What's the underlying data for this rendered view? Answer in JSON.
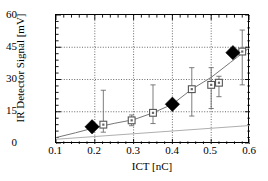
{
  "chart_data": {
    "type": "scatter",
    "title": "",
    "xlabel": "ICT [nC]",
    "ylabel": "IR Detector Signal [mV]",
    "xlim": [
      0.1,
      0.6
    ],
    "ylim": [
      0,
      60
    ],
    "xticks": [
      "0.1",
      "0.2",
      "0.3",
      "0.4",
      "0.5",
      "0.6"
    ],
    "xtick_values": [
      0.1,
      0.2,
      0.3,
      0.4,
      0.5,
      0.6
    ],
    "yticks": [
      "0",
      "15",
      "30",
      "45",
      "60"
    ],
    "ytick_values": [
      0,
      15,
      30,
      45,
      60
    ],
    "grid": "dotted-both",
    "legend": "none",
    "minor_ticks": true,
    "series": [
      {
        "name": "measurement",
        "marker": "open-square",
        "marker_color": "#555555",
        "x": [
          0.222,
          0.295,
          0.35,
          0.45,
          0.5,
          0.52,
          0.58
        ],
        "y": [
          9.0,
          11.0,
          14.5,
          25.5,
          27.5,
          28.5,
          43.0
        ],
        "yerr_low": [
          5.5,
          8.5,
          9.5,
          13.0,
          16.5,
          22.0,
          27.5
        ],
        "yerr_high": [
          25.0,
          13.5,
          27.5,
          35.5,
          35.5,
          31.5,
          53.0
        ]
      },
      {
        "name": "simulation",
        "marker": "filled-diamond",
        "marker_color": "#000000",
        "x": [
          0.193,
          0.4,
          0.556
        ],
        "y": [
          8.0,
          18.5,
          42.5
        ]
      }
    ],
    "lines": [
      {
        "name": "fit-curve",
        "style": "solid-thin",
        "color": "#777777",
        "x": [
          0.1,
          0.15,
          0.2,
          0.25,
          0.3,
          0.35,
          0.4,
          0.45,
          0.5,
          0.55,
          0.6
        ],
        "y": [
          3.0,
          5.2,
          7.6,
          9.6,
          11.3,
          14.5,
          18.5,
          25.5,
          31.0,
          38.0,
          45.0
        ]
      },
      {
        "name": "baseline-line",
        "style": "solid-thin",
        "color": "#999999",
        "x": [
          0.1,
          0.6
        ],
        "y": [
          2.2,
          8.6
        ]
      }
    ]
  }
}
